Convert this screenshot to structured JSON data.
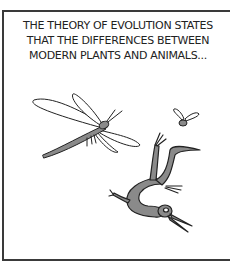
{
  "comic_panel": {
    "caption_lines": [
      "THE THEORY OF EVOLUTION STATES",
      "THAT THE DIFFERENCES BETWEEN",
      "MODERN PLANTS AND ANIMALS..."
    ],
    "figures": [
      "dragonfly",
      "fly",
      "prehistoric-creature"
    ],
    "colors": {
      "border": "#3a3a3a",
      "ink": "#222222",
      "fill": "#8a8a8a",
      "background": "#ffffff"
    }
  }
}
